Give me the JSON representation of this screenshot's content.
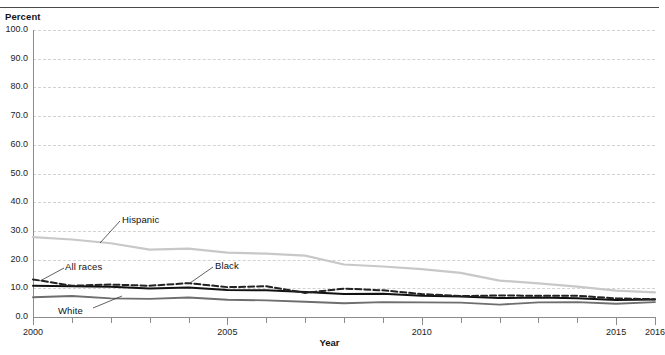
{
  "axes": {
    "y_title": "Percent",
    "x_title": "Year",
    "y_ticks": [
      "0.0",
      "10.0",
      "20.0",
      "30.0",
      "40.0",
      "50.0",
      "60.0",
      "70.0",
      "80.0",
      "90.0",
      "100.0"
    ],
    "x_tick_labels": [
      "2000",
      "2005",
      "2010",
      "2015",
      "2016"
    ]
  },
  "series_labels": {
    "hispanic": "Hispanic",
    "all_races": "All races",
    "black": "Black",
    "white": "White"
  },
  "colors": {
    "hispanic": "#c8c8c8",
    "all_races": "#111111",
    "black": "#222222",
    "white": "#6e6e6e",
    "grid": "#d2d2d2",
    "axis": "#8c8c8c"
  },
  "chart_data": {
    "type": "line",
    "title": "",
    "xlabel": "Year",
    "ylabel": "Percent",
    "xlim": [
      2000,
      2016
    ],
    "ylim": [
      0.0,
      100.0
    ],
    "grid": true,
    "legend": "inline-annotations",
    "x": [
      2000,
      2001,
      2002,
      2003,
      2004,
      2005,
      2006,
      2007,
      2008,
      2009,
      2010,
      2011,
      2012,
      2013,
      2014,
      2015,
      2016
    ],
    "series": [
      {
        "name": "Hispanic",
        "style": "solid",
        "color": "#c8c8c8",
        "values": [
          27.8,
          27.0,
          25.7,
          23.5,
          23.8,
          22.4,
          22.1,
          21.4,
          18.3,
          17.6,
          16.7,
          15.4,
          12.7,
          11.7,
          10.6,
          9.2,
          8.6
        ]
      },
      {
        "name": "All races",
        "style": "solid",
        "color": "#111111",
        "values": [
          10.9,
          10.7,
          10.5,
          9.9,
          10.3,
          9.4,
          9.3,
          8.7,
          8.0,
          8.1,
          7.4,
          7.1,
          6.6,
          6.8,
          6.5,
          5.9,
          6.1
        ]
      },
      {
        "name": "Black",
        "style": "dashed",
        "color": "#222222",
        "values": [
          13.1,
          10.9,
          11.3,
          10.9,
          11.8,
          10.4,
          10.7,
          8.4,
          9.9,
          9.3,
          8.0,
          7.3,
          7.5,
          7.4,
          7.4,
          6.5,
          6.2
        ]
      },
      {
        "name": "White",
        "style": "solid",
        "color": "#6e6e6e",
        "values": [
          6.9,
          7.3,
          6.5,
          6.3,
          6.8,
          6.0,
          5.8,
          5.3,
          4.8,
          5.2,
          5.1,
          5.0,
          4.3,
          5.1,
          5.2,
          4.6,
          5.2
        ]
      }
    ]
  }
}
